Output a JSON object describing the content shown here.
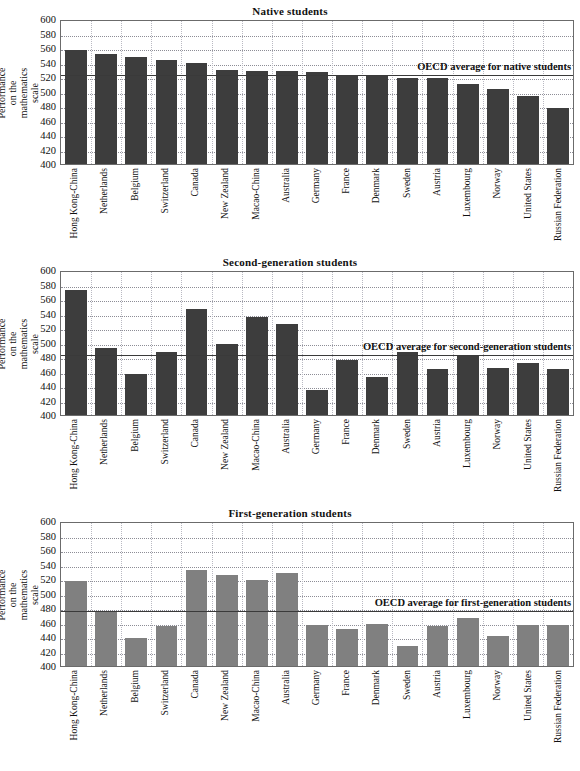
{
  "figure": {
    "y_axis_title": "Performance on the mathematics scale",
    "categories": [
      "Hong Kong-China",
      "Netherlands",
      "Belgium",
      "Switzerland",
      "Canada",
      "New Zealand",
      "Macao-China",
      "Australia",
      "Germany",
      "France",
      "Denmark",
      "Sweden",
      "Austria",
      "Luxembourg",
      "Norway",
      "United States",
      "Russian Federation"
    ],
    "y_ticks": [
      600,
      580,
      560,
      540,
      520,
      500,
      480,
      460,
      440,
      420,
      400
    ],
    "colors": {
      "bar_dark": "#3d3d3d",
      "bar_light": "#808080",
      "axis": "#6b6b6b",
      "gridline": "#8d8d96",
      "average_line": "#3a3a3a"
    }
  },
  "chart_data": [
    {
      "type": "bar",
      "title": "Native students",
      "xlabel": "",
      "ylabel": "Performance on the mathematics scale",
      "ylim": [
        400,
        600
      ],
      "ytick_step": 20,
      "grid": true,
      "legend": "none",
      "bar_color": "#3d3d3d",
      "categories": [
        "Hong Kong-China",
        "Netherlands",
        "Belgium",
        "Switzerland",
        "Canada",
        "New Zealand",
        "Macao-China",
        "Australia",
        "Germany",
        "France",
        "Denmark",
        "Sweden",
        "Austria",
        "Luxembourg",
        "Norway",
        "United States",
        "Russian Federation"
      ],
      "values": [
        557,
        552,
        547,
        544,
        539,
        529,
        528,
        528,
        527,
        521,
        521,
        519,
        518,
        511,
        504,
        494,
        477
      ],
      "reference_line": {
        "label": "OECD average for native students",
        "value": 525
      }
    },
    {
      "type": "bar",
      "title": "Second-generation students",
      "xlabel": "",
      "ylabel": "Performance on the mathematics scale",
      "ylim": [
        400,
        600
      ],
      "ytick_step": 20,
      "grid": true,
      "legend": "none",
      "bar_color": "#3d3d3d",
      "categories": [
        "Hong Kong-China",
        "Netherlands",
        "Belgium",
        "Switzerland",
        "Canada",
        "New Zealand",
        "Macao-China",
        "Australia",
        "Germany",
        "France",
        "Denmark",
        "Sweden",
        "Austria",
        "Luxembourg",
        "Norway",
        "United States",
        "Russian Federation"
      ],
      "values": [
        572,
        493,
        456,
        487,
        546,
        498,
        535,
        525,
        435,
        476,
        453,
        487,
        463,
        482,
        465,
        472,
        463
      ],
      "reference_line": {
        "label": "OECD average for second-generation students",
        "value": 486
      }
    },
    {
      "type": "bar",
      "title": "First-generation students",
      "xlabel": "",
      "ylabel": "Performance on the mathematics scale",
      "ylim": [
        400,
        600
      ],
      "ytick_step": 20,
      "grid": true,
      "legend": "none",
      "bar_color": "#808080",
      "categories": [
        "Hong Kong-China",
        "Netherlands",
        "Belgium",
        "Switzerland",
        "Canada",
        "New Zealand",
        "Macao-China",
        "Australia",
        "Germany",
        "France",
        "Denmark",
        "Sweden",
        "Austria",
        "Luxembourg",
        "Norway",
        "United States",
        "Russian Federation"
      ],
      "values": [
        517,
        475,
        438,
        455,
        533,
        525,
        519,
        528,
        457,
        451,
        458,
        428,
        455,
        466,
        441,
        457,
        456
      ],
      "reference_line": {
        "label": "OECD average for first-generation students",
        "value": 479
      }
    }
  ]
}
